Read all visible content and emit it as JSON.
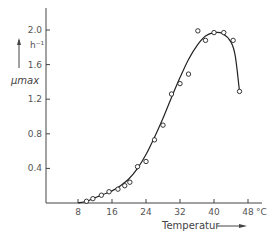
{
  "chart_data": {
    "type": "scatter",
    "title": "",
    "xlabel": "Temperatur",
    "x_unit": "°C",
    "ylabel": "μmax",
    "y_unit": "h⁻¹",
    "xlim": [
      6,
      50
    ],
    "ylim": [
      0,
      2.2
    ],
    "x_ticks": [
      8,
      16,
      24,
      32,
      40,
      48
    ],
    "x_tick_labels": [
      "8",
      "16",
      "24",
      "32",
      "40",
      "48"
    ],
    "y_ticks": [
      0.4,
      0.8,
      1.2,
      1.6,
      2.0
    ],
    "y_tick_labels": [
      "0.4",
      "0.8",
      "1.2",
      "1.6",
      "2.0"
    ],
    "grid": false,
    "legend": null,
    "series": [
      {
        "name": "measured",
        "style": "open-circle",
        "x": [
          10,
          11.5,
          13.5,
          15.3,
          17.4,
          19,
          20.2,
          22,
          24,
          26,
          28,
          30,
          32,
          34,
          36.2,
          38,
          40,
          42.3,
          44.5,
          46
        ],
        "y": [
          0.02,
          0.05,
          0.09,
          0.13,
          0.16,
          0.2,
          0.24,
          0.42,
          0.48,
          0.73,
          0.9,
          1.26,
          1.38,
          1.49,
          1.99,
          1.88,
          1.97,
          1.97,
          1.88,
          1.29
        ]
      },
      {
        "name": "fitted curve",
        "style": "line",
        "x": [
          8,
          10,
          12,
          14,
          16,
          18,
          20,
          22,
          24,
          26,
          28,
          30,
          32,
          34,
          36,
          38,
          40,
          42,
          44,
          45,
          46
        ],
        "y": [
          0.0,
          0.02,
          0.06,
          0.1,
          0.14,
          0.2,
          0.28,
          0.4,
          0.56,
          0.76,
          0.98,
          1.22,
          1.45,
          1.66,
          1.82,
          1.93,
          1.97,
          1.96,
          1.86,
          1.7,
          1.29
        ]
      }
    ]
  }
}
